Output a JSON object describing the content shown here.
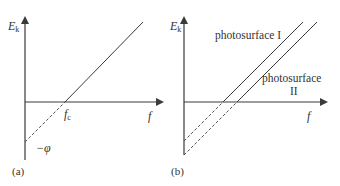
{
  "panels": [
    {
      "id": "a",
      "panel_label": "(a)",
      "y_axis_label": "E",
      "y_axis_label_sub": "k",
      "x_axis_label": "f",
      "threshold_label": "f",
      "threshold_label_sub": "c",
      "intercept_label": "−φ",
      "lines": [
        {
          "name": "Ek vs f",
          "style": "solid+dashed extrapolation"
        }
      ]
    },
    {
      "id": "b",
      "panel_label": "(b)",
      "y_axis_label": "E",
      "y_axis_label_sub": "k",
      "x_axis_label": "f",
      "lines": [
        {
          "name": "photosurface I",
          "label": "photosurface I"
        },
        {
          "name": "photosurface II",
          "label_line1": "photosurface",
          "label_line2": "II"
        }
      ]
    }
  ],
  "colors": {
    "line": "#3a3a3a",
    "text": "#333333",
    "background": "#ffffff"
  }
}
